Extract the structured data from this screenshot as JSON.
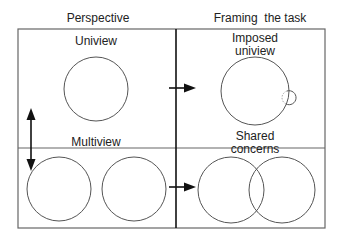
{
  "headers": {
    "left": "Perspective",
    "right": "Framing  the task"
  },
  "quadrants": {
    "top_left": {
      "label": "Uniview"
    },
    "top_right": {
      "label_line1": "Imposed",
      "label_line2": "uniview"
    },
    "bottom_left": {
      "label": "Multiview"
    },
    "bottom_right": {
      "label_line1": "Shared",
      "label_line2": "concerns"
    }
  },
  "colors": {
    "stroke": "#555555",
    "divider": "#111111",
    "arrow": "#111111"
  }
}
